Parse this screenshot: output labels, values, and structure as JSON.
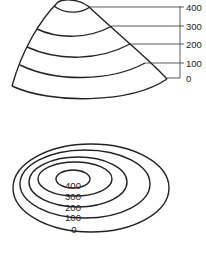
{
  "diagram": {
    "type": "contour-lines-illustration",
    "hill_profile": {
      "axis_labels": [
        "400",
        "300",
        "200",
        "100",
        "0"
      ]
    },
    "contour_map": {
      "contour_labels": [
        "400",
        "300",
        "200",
        "100",
        "0"
      ]
    },
    "colors": {
      "line": "#222222",
      "background": "#ffffff"
    }
  }
}
